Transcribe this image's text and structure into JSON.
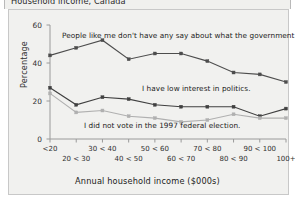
{
  "window": {
    "title": "Household income, Canada"
  },
  "chart_data": {
    "type": "line",
    "title": "Household income, Canada",
    "xlabel": "Annual household income ($000s)",
    "ylabel": "Percentage",
    "ylim": [
      0,
      60
    ],
    "yticks": [
      0,
      20,
      40,
      60
    ],
    "grid": false,
    "legend_position": "inline-annotations",
    "categories": [
      "<20",
      "20 < 30",
      "30 < 40",
      "40 < 50",
      "50 < 60",
      "60 < 70",
      "70 < 80",
      "80 < 90",
      "90 < 100",
      "100+"
    ],
    "series": [
      {
        "name": "People like me don't have any say about what the government does.",
        "color": "#4d4d4d",
        "marker": "square",
        "values": [
          44,
          48,
          52,
          42,
          45,
          45,
          41,
          35,
          34,
          30
        ]
      },
      {
        "name": "I have low interest in politics.",
        "color": "#404040",
        "marker": "square",
        "values": [
          27,
          18,
          22,
          21,
          18,
          17,
          17,
          17,
          12,
          16
        ]
      },
      {
        "name": "I did not vote in the 1997 federal election.",
        "color": "#b0b0b0",
        "marker": "square",
        "values": [
          24,
          14,
          15,
          12,
          11,
          9,
          10,
          13,
          11,
          11
        ]
      }
    ],
    "annotations": [
      {
        "text": "People like me don't have any say about what the government does.",
        "x_px": 62,
        "y_px": 31
      },
      {
        "text": "I have low interest in politics.",
        "x_px": 142,
        "y_px": 84
      },
      {
        "text": "I did not vote in the 1997 federal election.",
        "x_px": 84,
        "y_px": 121
      }
    ]
  },
  "colors": {
    "panel_background": "#f1f1ef",
    "panel_border": "#c8c8c8",
    "axis": "#9a9a9a",
    "series_dark": "#4d4d4d",
    "series_light": "#b0b0b0",
    "text": "#222222"
  }
}
